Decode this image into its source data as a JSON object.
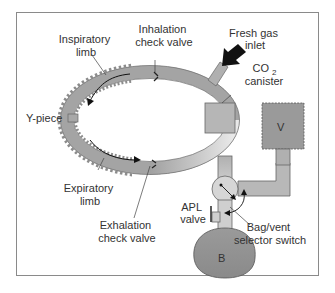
{
  "diagram": {
    "labels": {
      "inspiratory_limb": [
        "Inspiratory",
        "limb"
      ],
      "inhalation_check_valve": [
        "Inhalation",
        "check valve"
      ],
      "fresh_gas_inlet": [
        "Fresh gas",
        "inlet"
      ],
      "co2_canister": [
        "CO",
        "2",
        "canister"
      ],
      "y_piece": "Y-piece",
      "expiratory_limb": [
        "Expiratory",
        "limb"
      ],
      "exhalation_check_valve": [
        "Exhalation",
        "check valve"
      ],
      "apl_valve": [
        "APL",
        "valve"
      ],
      "bag_vent_switch": [
        "Bag/vent",
        "selector switch"
      ],
      "ventilator": "V",
      "bag": "B"
    },
    "colors": {
      "tube": "#a8a8a8",
      "tube_dark": "#8c8c8c",
      "tube_light": "#e4e4e4",
      "outline": "#555555",
      "frame": "#888888",
      "text": "#333333",
      "arrow": "#111111"
    }
  }
}
